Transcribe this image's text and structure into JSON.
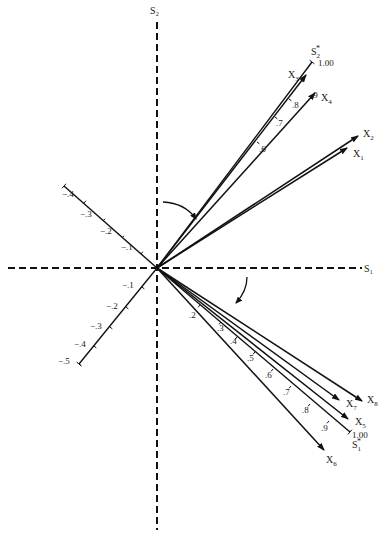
{
  "diagram": {
    "title": "",
    "origin": [
      157,
      268
    ],
    "axes": {
      "s1": {
        "label": "S₁",
        "from": [
          8,
          268
        ],
        "to": [
          362,
          268
        ],
        "label_pos": [
          364,
          272
        ]
      },
      "s2": {
        "label": "S₂",
        "from": [
          157,
          22
        ],
        "to": [
          157,
          530
        ],
        "label_pos": [
          150,
          14
        ]
      }
    },
    "oblique_axes": [
      {
        "name": "upper-left-axis",
        "end": [
          64,
          186
        ],
        "ticks": [
          {
            "label": "−.1",
            "pos": [
              141,
              254
            ],
            "lbl": [
              121,
              250
            ]
          },
          {
            "label": "−.2",
            "pos": [
              122,
              238
            ],
            "lbl": [
              100,
              234
            ]
          },
          {
            "label": "−.3",
            "pos": [
              103,
              221
            ],
            "lbl": [
              80,
              217
            ]
          },
          {
            "label": "−.4",
            "pos": [
              84,
              203
            ],
            "lbl": [
              62,
              197
            ]
          }
        ]
      },
      {
        "name": "lower-left-axis",
        "end": [
          79,
          364
        ],
        "ticks": [
          {
            "label": "−.1",
            "pos": [
              142,
              287
            ],
            "lbl": [
              122,
              288
            ]
          },
          {
            "label": "−.2",
            "pos": [
              126,
              307
            ],
            "lbl": [
              106,
              309
            ]
          },
          {
            "label": "−.3",
            "pos": [
              110,
              327
            ],
            "lbl": [
              90,
              329
            ]
          },
          {
            "label": "−.4",
            "pos": [
              94,
              346
            ],
            "lbl": [
              74,
              347
            ]
          },
          {
            "label": "−.5",
            "pos": [
              79,
              364
            ],
            "lbl": [
              58,
              364
            ]
          }
        ]
      }
    ],
    "rotated_axes": [
      {
        "name": "s2-star",
        "label": "S₂*",
        "end": [
          312,
          62
        ],
        "label_pos": [
          311,
          55
        ],
        "end_value": "1.00",
        "end_value_pos": [
          318,
          66
        ],
        "ticks": [
          {
            "label": ".6",
            "pos": [
              257,
              142
            ],
            "lbl": [
              259,
              152
            ]
          },
          {
            "label": ".7",
            "pos": [
              275,
              117
            ],
            "lbl": [
              276,
              126
            ]
          },
          {
            "label": ".8",
            "pos": [
              289,
              99
            ],
            "lbl": [
              292,
              108
            ]
          },
          {
            "label": ".9",
            "pos": [
              301,
              80
            ],
            "lbl": [
              311,
              98
            ]
          }
        ]
      },
      {
        "name": "s1-star",
        "label": "S₁*",
        "end": [
          350,
          432
        ],
        "label_pos": [
          352,
          448
        ],
        "end_value": "1.00",
        "end_value_pos": [
          352,
          438
        ],
        "ticks": [
          {
            "label": ".2",
            "pos": [
              200,
              305
            ],
            "lbl": [
              189,
              318
            ]
          },
          {
            "label": ".3",
            "pos": [
              221,
              322
            ],
            "lbl": [
              217,
              331
            ]
          },
          {
            "label": ".4",
            "pos": [
              237,
              337
            ],
            "lbl": [
              230,
              344
            ]
          },
          {
            "label": ".5",
            "pos": [
              255,
              352
            ],
            "lbl": [
              247,
              361
            ]
          },
          {
            "label": ".6",
            "pos": [
              273,
              369
            ],
            "lbl": [
              265,
              378
            ]
          },
          {
            "label": ".7",
            "pos": [
              291,
              386
            ],
            "lbl": [
              283,
              395
            ]
          },
          {
            "label": ".8",
            "pos": [
              310,
              404
            ],
            "lbl": [
              302,
              413
            ]
          },
          {
            "label": ".9",
            "pos": [
              329,
              421
            ],
            "lbl": [
              321,
              431
            ]
          }
        ]
      }
    ],
    "vectors": [
      {
        "name": "x3",
        "label": "X",
        "sub": "3",
        "end": [
          306,
          75
        ],
        "label_pos": [
          288,
          78
        ]
      },
      {
        "name": "x4",
        "label": "X",
        "sub": "4",
        "end": [
          315,
          93
        ],
        "label_pos": [
          321,
          101
        ]
      },
      {
        "name": "x2",
        "label": "X",
        "sub": "2",
        "end": [
          358,
          136
        ],
        "label_pos": [
          363,
          137
        ]
      },
      {
        "name": "x1",
        "label": "X",
        "sub": "1",
        "end": [
          347,
          148
        ],
        "label_pos": [
          353,
          157
        ]
      },
      {
        "name": "x8",
        "label": "X",
        "sub": "8",
        "end": [
          362,
          401
        ],
        "label_pos": [
          367,
          403
        ]
      },
      {
        "name": "x7",
        "label": "X",
        "sub": "7",
        "end": [
          339,
          400
        ],
        "label_pos": [
          346,
          407
        ]
      },
      {
        "name": "x5",
        "label": "X",
        "sub": "5",
        "end": [
          348,
          419
        ],
        "label_pos": [
          355,
          425
        ]
      },
      {
        "name": "x6",
        "label": "X",
        "sub": "6",
        "end": [
          324,
          450
        ],
        "label_pos": [
          326,
          463
        ]
      }
    ],
    "rotation_arrows": [
      {
        "name": "upper-rotation-arrow",
        "path": "M 163 202 Q 185 203 196 219",
        "head": [
          196,
          219
        ]
      },
      {
        "name": "lower-rotation-arrow",
        "path": "M 247 277 Q 247 291 236 303",
        "head": [
          236,
          303
        ]
      }
    ]
  }
}
